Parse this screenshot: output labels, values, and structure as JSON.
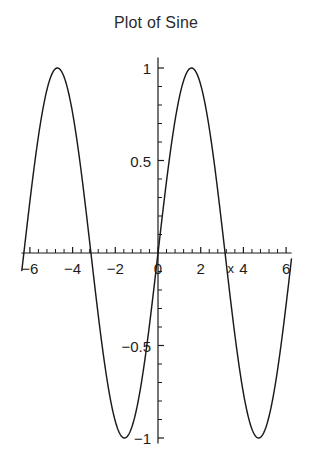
{
  "chart_data": {
    "type": "line",
    "title": "Plot of Sine",
    "xlabel": "x",
    "ylabel": "",
    "function": "sin(x)",
    "xlim": [
      -6.4,
      6.4
    ],
    "ylim": [
      -1.08,
      1.08
    ],
    "grid": false,
    "legend": null,
    "x_ticks": [
      -6,
      -4,
      -2,
      0,
      2,
      4,
      6
    ],
    "x_tick_labels": [
      "-6",
      "-4",
      "-2",
      "0",
      "2",
      "4",
      "6"
    ],
    "x_minor_tick_step": 0.4,
    "y_ticks": [
      -1,
      -0.5,
      0.5,
      1
    ],
    "y_tick_labels": [
      "-1",
      "-0.5",
      "0.5",
      "1"
    ],
    "y_minor_tick_step": 0.1,
    "series": [
      {
        "name": "sin(x)",
        "color": "#1a1a1a",
        "x": [
          -6.28,
          -6.0,
          -5.6,
          -5.2,
          -4.8,
          -4.712,
          -4.4,
          -4.0,
          -3.6,
          -3.2,
          -3.1416,
          -2.8,
          -2.4,
          -2.0,
          -1.6,
          -1.571,
          -1.2,
          -0.8,
          -0.4,
          0.0,
          0.4,
          0.8,
          1.2,
          1.571,
          1.6,
          2.0,
          2.4,
          2.8,
          3.1416,
          3.2,
          3.6,
          4.0,
          4.4,
          4.712,
          4.8,
          5.2,
          5.6,
          6.0,
          6.28
        ],
        "y": [
          0.0,
          0.279,
          0.631,
          0.883,
          0.996,
          1.0,
          0.952,
          0.757,
          0.443,
          0.058,
          0.0,
          -0.335,
          -0.675,
          -0.909,
          -0.9996,
          -1.0,
          -0.932,
          -0.717,
          -0.389,
          0.0,
          0.389,
          0.717,
          0.932,
          1.0,
          0.9996,
          0.909,
          0.675,
          0.335,
          0.0,
          -0.058,
          -0.443,
          -0.757,
          -0.952,
          -1.0,
          -0.996,
          -0.883,
          -0.631,
          -0.279,
          0.0
        ]
      }
    ],
    "annotations": [
      {
        "text": "x",
        "x": 3.25,
        "y": -0.11
      }
    ],
    "peaks": [
      {
        "x": -4.712,
        "y": 1
      },
      {
        "x": 1.571,
        "y": 1
      }
    ],
    "troughs": [
      {
        "x": -1.571,
        "y": -1
      },
      {
        "x": 4.712,
        "y": -1
      }
    ],
    "zero_crossings": [
      -6.283,
      -3.1416,
      0,
      3.1416,
      6.283
    ],
    "background_color": "#ffffff",
    "axis_color": "#1a1a1a"
  }
}
